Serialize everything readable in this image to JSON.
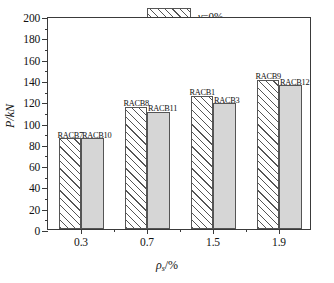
{
  "chart_data": {
    "type": "bar",
    "title": "",
    "subtitle": "",
    "xlabel": "ρs/%",
    "ylabel": "P/kN",
    "categories": [
      "0.3",
      "0.7",
      "1.5",
      "1.9"
    ],
    "ylim": [
      0,
      200
    ],
    "y_tick_step": 20,
    "y_ticks": [
      "0",
      "20",
      "40",
      "60",
      "80",
      "100",
      "120",
      "140",
      "160",
      "180",
      "200"
    ],
    "grid": false,
    "legend_position": "top-right",
    "series": [
      {
        "name": "γ=0%",
        "fill": "hatched",
        "values": [
          85,
          115,
          125,
          140
        ],
        "point_labels": [
          "RACB7",
          "RACB8",
          "RACB1",
          "RACB9"
        ]
      },
      {
        "name": "γ=100%",
        "fill": "solid-gray",
        "values": [
          85,
          110,
          118,
          135
        ],
        "point_labels": [
          "RACB10",
          "RACB11",
          "RACB3",
          "RACB12"
        ]
      }
    ]
  },
  "axes": {
    "y_title": "P/kN",
    "y_title_symbol": "P",
    "y_title_unit": "/kN",
    "x_title_symbol": "ρ",
    "x_title_subscript": "s",
    "x_title_unit": "/%"
  },
  "legend": {
    "items": [
      {
        "symbol": "γ",
        "label": "=0%",
        "swatch": "hatched"
      },
      {
        "symbol": "γ",
        "label": "=100%",
        "swatch": "solid-gray"
      }
    ]
  },
  "colors": {
    "axis": "#3a3a3a",
    "bar_outline": "#555555",
    "bar_solid_fill": "#d6d6d6",
    "bar_hatch_fill": "#ffffff",
    "text": "#111111",
    "background": "#ffffff"
  }
}
